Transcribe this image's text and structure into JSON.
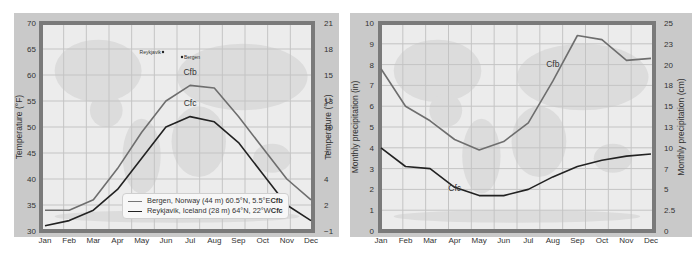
{
  "chart_data": [
    {
      "type": "line",
      "title": "",
      "xlabel": "",
      "ylabel": "Temperature (°F)",
      "ylabel_right": "Temperature (°C)",
      "categories": [
        "Jan",
        "Feb",
        "Mar",
        "Apr",
        "May",
        "Jun",
        "Jul",
        "Aug",
        "Sep",
        "Oct",
        "Nov",
        "Dec"
      ],
      "ylim": [
        30,
        70
      ],
      "yticks": [
        30,
        35,
        40,
        45,
        50,
        55,
        60,
        65,
        70
      ],
      "ylim_right": [
        -1,
        21
      ],
      "yticks_right": [
        "−1",
        "2",
        "4",
        "7",
        "10",
        "13",
        "15",
        "18",
        "21"
      ],
      "grid": true,
      "series": [
        {
          "name": "Bergen, Norway (44 m) 60.5°N, 5.5°E",
          "code": "Cfb",
          "color": "#6e6e6e",
          "values": [
            34,
            34,
            36,
            42,
            49,
            55,
            58,
            57.5,
            52,
            46,
            40,
            36
          ]
        },
        {
          "name": "Reykjavik, Iceland (28 m) 64°N, 22°W",
          "code": "Cfc",
          "color": "#222222",
          "values": [
            31,
            32,
            34,
            38,
            44,
            50,
            52,
            51,
            47,
            41,
            35,
            32
          ]
        }
      ],
      "annotations": [
        {
          "text": "Cfb",
          "x": "Jul",
          "y": 60
        },
        {
          "text": "Cfc",
          "x": "Jul",
          "y": 54
        },
        {
          "text": "Reykjavik",
          "note": "map label"
        },
        {
          "text": "Bergen",
          "note": "map label"
        }
      ],
      "legend_position": "bottom-right"
    },
    {
      "type": "line",
      "title": "",
      "xlabel": "",
      "ylabel": "Monthly precipitation (in)",
      "ylabel_right": "Monthly precipitation (cm)",
      "categories": [
        "Jan",
        "Feb",
        "Mar",
        "Apr",
        "May",
        "Jun",
        "Jul",
        "Aug",
        "Sep",
        "Oct",
        "Nov",
        "Dec"
      ],
      "ylim": [
        0,
        10
      ],
      "yticks": [
        0,
        1,
        2,
        3,
        4,
        5,
        6,
        7,
        8,
        9,
        10
      ],
      "ylim_right": [
        0,
        25
      ],
      "yticks_right": [
        "0",
        "2.5",
        "5",
        "7",
        "10",
        "13",
        "15",
        "18",
        "20",
        "23",
        "25"
      ],
      "grid": true,
      "series": [
        {
          "name": "Bergen",
          "code": "Cfb",
          "color": "#6e6e6e",
          "values": [
            7.8,
            6.0,
            5.3,
            4.4,
            3.9,
            4.3,
            5.2,
            7.2,
            9.4,
            9.2,
            8.2,
            8.3
          ]
        },
        {
          "name": "Reykjavik",
          "code": "Cfc",
          "color": "#222222",
          "values": [
            4.0,
            3.1,
            3.0,
            2.1,
            1.7,
            1.7,
            2.0,
            2.6,
            3.1,
            3.4,
            3.6,
            3.7
          ]
        }
      ],
      "annotations": [
        {
          "text": "Cfb",
          "x": "Aug",
          "y": 7.9
        },
        {
          "text": "Cfc",
          "x": "Apr",
          "y": 1.9
        }
      ]
    }
  ],
  "legend": {
    "bergen_text": "Bergen, Norway (44 m) 60.5°N, 5.5°E ",
    "bergen_code": "Cfb",
    "reykjavik_text": "Reykjavik, Iceland (28 m) 64°N, 22°W ",
    "reykjavik_code": "Cfc"
  },
  "map_labels": {
    "reykjavik": "Reykjavik",
    "bergen": "Bergen"
  }
}
